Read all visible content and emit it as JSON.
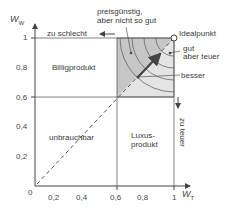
{
  "diagram": {
    "axes": {
      "x_label": "W",
      "x_sub": "T",
      "y_label": "W",
      "y_sub": "W",
      "origin": "0",
      "x_ticks": [
        "0,2",
        "0,4",
        "0,6",
        "0,8",
        "1"
      ],
      "y_ticks": [
        "0,2",
        "0,4",
        "0,6",
        "0,8",
        "1"
      ]
    },
    "regions": {
      "cheap": "Billigprodukt",
      "useless": "unbrauchbar",
      "luxury_line1": "Luxus-",
      "luxury_line2": "produkt"
    },
    "annotations": {
      "top_line1": "preisgünstig,",
      "top_line2": "aber nicht so gut",
      "ideal": "Idealpunkt",
      "good_line1": "gut",
      "good_line2": "aber teuer",
      "better": "besser",
      "too_bad": "zu schlecht",
      "too_expensive": "zu teuer"
    },
    "colors": {
      "shade": "#c8c8c8",
      "shade_light": "#e6e6e6",
      "line": "#555555"
    }
  }
}
